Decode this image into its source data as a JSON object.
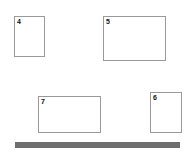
{
  "canvas": {
    "width": 186,
    "height": 152,
    "background_color": "#ffffff"
  },
  "style": {
    "box_border_color": "#9a9a9a",
    "box_fill_color": "#ffffff",
    "bar_color": "#6e6e6e",
    "label_color": "#111111"
  },
  "boxes": [
    {
      "label": "4",
      "name": "box-4",
      "x": 14,
      "y": 16,
      "width": 31,
      "height": 41
    },
    {
      "label": "5",
      "name": "box-5",
      "x": 103,
      "y": 16,
      "width": 63,
      "height": 45
    },
    {
      "label": "7",
      "name": "box-7",
      "x": 38,
      "y": 96,
      "width": 63,
      "height": 37
    },
    {
      "label": "6",
      "name": "box-6",
      "x": 150,
      "y": 92,
      "width": 32,
      "height": 41
    }
  ],
  "bar": {
    "name": "bottom-bar",
    "x": 15,
    "y": 142,
    "width": 165,
    "height": 6
  }
}
